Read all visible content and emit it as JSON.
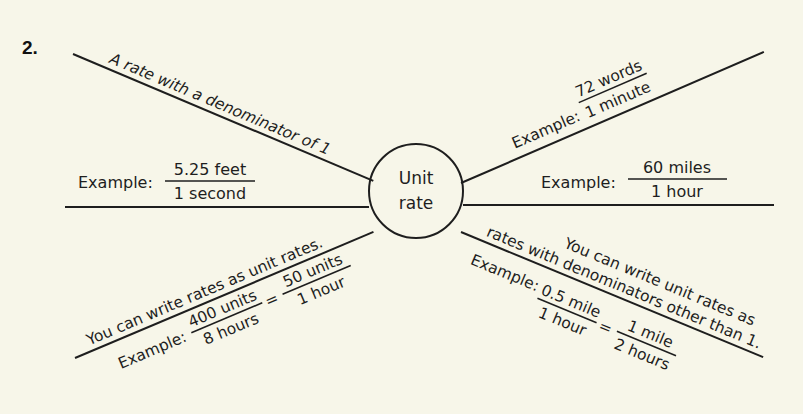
{
  "problem": {
    "number": "2."
  },
  "center": {
    "line1": "Unit",
    "line2": "rate"
  },
  "branches": {
    "definition": {
      "text": "A rate with a denominator of 1"
    },
    "example_left": {
      "label": "Example:",
      "numerator": "5.25 feet",
      "denominator": "1 second"
    },
    "example_upper_right": {
      "label": "Example:",
      "numerator": "72 words",
      "denominator": "1 minute"
    },
    "example_right": {
      "label": "Example:",
      "numerator": "60 miles",
      "denominator": "1 hour"
    },
    "rates_as_unit_rates": {
      "text": "You can write rates as unit rates.",
      "label": "Example:",
      "fraction1": {
        "numerator": "400 units",
        "denominator": "8 hours"
      },
      "equals": "=",
      "fraction2": {
        "numerator": "50 units",
        "denominator": "1 hour"
      }
    },
    "other_denominators": {
      "line1": "You can write unit rates as",
      "line2": "rates with denominators other than 1.",
      "label": "Example:",
      "fraction1": {
        "numerator": "0.5 mile",
        "denominator": "1 hour"
      },
      "equals": "=",
      "fraction2": {
        "numerator": "1 mile",
        "denominator": "2 hours"
      }
    }
  },
  "colors": {
    "background": "#f7f6e9",
    "ink": "#1e1e1e"
  }
}
